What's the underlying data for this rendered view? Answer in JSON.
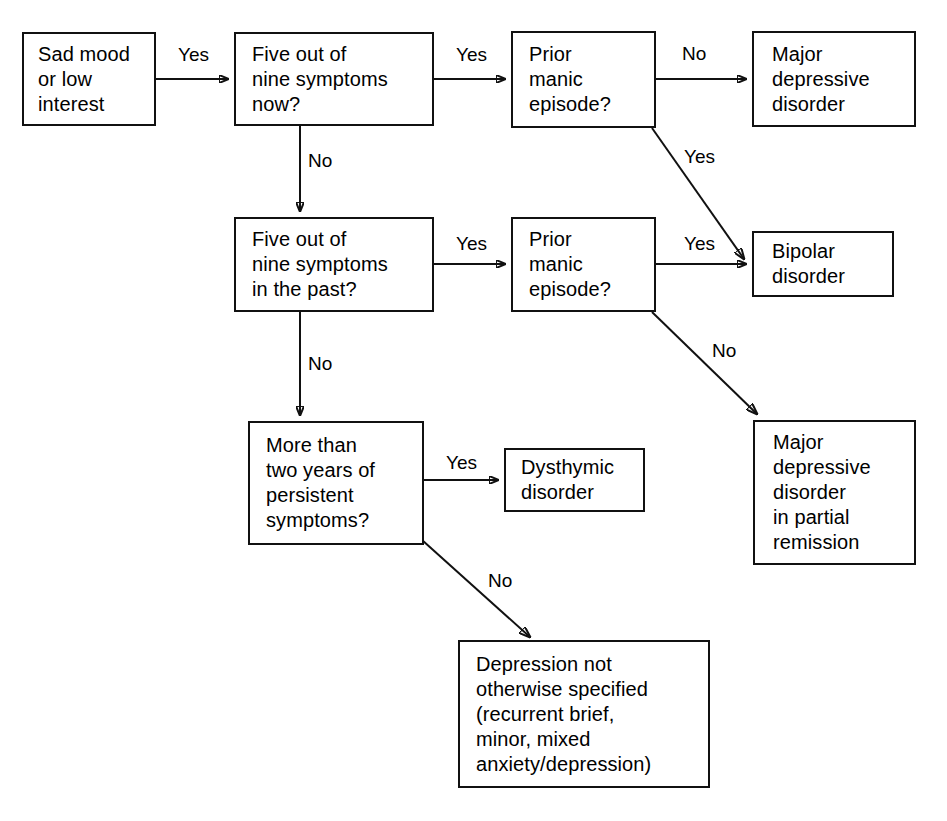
{
  "diagram": {
    "background_color": "#ffffff",
    "line_color": "#111111",
    "text_color": "#000000",
    "nodes": [
      {
        "id": "sad_mood",
        "text": "Sad mood\nor low\ninterest",
        "x": 22,
        "y": 32,
        "w": 134,
        "h": 94,
        "pad_left": 14,
        "indent": "none"
      },
      {
        "id": "five_now",
        "text": "Five out of\n  nine symptoms\n  now?",
        "x": 234,
        "y": 32,
        "w": 200,
        "h": 94,
        "pad_left": 16,
        "indent": "hanging"
      },
      {
        "id": "prior_manic_1",
        "text": "Prior\n  manic\n  episode?",
        "x": 511,
        "y": 31,
        "w": 145,
        "h": 97,
        "pad_left": 16,
        "indent": "hanging"
      },
      {
        "id": "major_depressive",
        "text": "Major\n  depressive\n  disorder",
        "x": 752,
        "y": 31,
        "w": 164,
        "h": 96,
        "pad_left": 18,
        "indent": "hanging"
      },
      {
        "id": "five_past",
        "text": "Five out of\n  nine symptoms\n  in the past?",
        "x": 234,
        "y": 217,
        "w": 200,
        "h": 95,
        "pad_left": 16,
        "indent": "hanging"
      },
      {
        "id": "prior_manic_2",
        "text": "Prior\n  manic\n  episode?",
        "x": 511,
        "y": 217,
        "w": 145,
        "h": 95,
        "pad_left": 16,
        "indent": "hanging"
      },
      {
        "id": "bipolar",
        "text": "Bipolar\n  disorder",
        "x": 752,
        "y": 231,
        "w": 142,
        "h": 66,
        "pad_left": 18,
        "indent": "hanging"
      },
      {
        "id": "two_years",
        "text": "More than\n  two years of\n  persistent\n  symptoms?",
        "x": 248,
        "y": 421,
        "w": 176,
        "h": 124,
        "pad_left": 16,
        "indent": "hanging"
      },
      {
        "id": "dysthymic",
        "text": "Dysthymic\n  disorder",
        "x": 504,
        "y": 448,
        "w": 141,
        "h": 64,
        "pad_left": 15,
        "indent": "hanging"
      },
      {
        "id": "partial_remission",
        "text": "Major\n  depressive\n  disorder\n  in partial\n  remission",
        "x": 753,
        "y": 420,
        "w": 163,
        "h": 145,
        "pad_left": 18,
        "indent": "hanging"
      },
      {
        "id": "depression_nos",
        "text": "Depression not\n  otherwise specified\n  (recurrent brief,\n  minor, mixed\n  anxiety/depression)",
        "x": 458,
        "y": 640,
        "w": 252,
        "h": 148,
        "pad_left": 16,
        "indent": "hanging"
      }
    ],
    "edge_labels": [
      {
        "id": "lbl_yes_1",
        "text": "Yes",
        "x": 178,
        "y": 44
      },
      {
        "id": "lbl_yes_2",
        "text": "Yes",
        "x": 456,
        "y": 44
      },
      {
        "id": "lbl_no_1",
        "text": "No",
        "x": 682,
        "y": 43
      },
      {
        "id": "lbl_no_2",
        "text": "No",
        "x": 308,
        "y": 150
      },
      {
        "id": "lbl_yes_3",
        "text": "Yes",
        "x": 684,
        "y": 146
      },
      {
        "id": "lbl_yes_4",
        "text": "Yes",
        "x": 456,
        "y": 233
      },
      {
        "id": "lbl_yes_5",
        "text": "Yes",
        "x": 684,
        "y": 233
      },
      {
        "id": "lbl_no_3",
        "text": "No",
        "x": 308,
        "y": 353
      },
      {
        "id": "lbl_no_4",
        "text": "No",
        "x": 712,
        "y": 340
      },
      {
        "id": "lbl_yes_6",
        "text": "Yes",
        "x": 446,
        "y": 452
      },
      {
        "id": "lbl_no_5",
        "text": "No",
        "x": 488,
        "y": 570
      }
    ],
    "edges": [
      {
        "id": "e-sadmood-to-fivenow",
        "type": "straight",
        "from": "sad_mood",
        "to": "five_now",
        "answer": "Yes",
        "d": "M 156 79 L 228 79"
      },
      {
        "id": "e-fivenow-to-priormanic1",
        "type": "straight",
        "from": "five_now",
        "to": "prior_manic_1",
        "answer": "Yes",
        "d": "M 434 79 L 505 79"
      },
      {
        "id": "e-priormanic1-to-majordep",
        "type": "straight",
        "from": "prior_manic_1",
        "to": "major_depressive",
        "answer": "No",
        "d": "M 656 79 L 746 79"
      },
      {
        "id": "e-fivenow-to-fivepast",
        "type": "straight",
        "from": "five_now",
        "to": "five_past",
        "answer": "No",
        "d": "M 300 126 L 300 211"
      },
      {
        "id": "e-priormanic1-to-bipolar",
        "type": "diagonal",
        "from": "prior_manic_1",
        "to": "bipolar",
        "answer": "Yes",
        "d": "M 652 128 L 744 259"
      },
      {
        "id": "e-fivepast-to-priormanic2",
        "type": "straight",
        "from": "five_past",
        "to": "prior_manic_2",
        "answer": "Yes",
        "d": "M 434 264 L 505 264"
      },
      {
        "id": "e-priormanic2-to-bipolar",
        "type": "straight",
        "from": "prior_manic_2",
        "to": "bipolar",
        "answer": "Yes",
        "d": "M 656 264 L 746 264"
      },
      {
        "id": "e-fivepast-to-twoyears",
        "type": "straight",
        "from": "five_past",
        "to": "two_years",
        "answer": "No",
        "d": "M 300 312 L 300 415"
      },
      {
        "id": "e-priormanic2-to-partial",
        "type": "diagonal",
        "from": "prior_manic_2",
        "to": "partial_remission",
        "answer": "No",
        "d": "M 652 312 L 757 414"
      },
      {
        "id": "e-twoyears-to-dysthymic",
        "type": "straight",
        "from": "two_years",
        "to": "dysthymic",
        "answer": "Yes",
        "d": "M 424 480 L 498 480"
      },
      {
        "id": "e-twoyears-to-nos",
        "type": "diagonal",
        "from": "two_years",
        "to": "depression_nos",
        "answer": "No",
        "d": "M 422 540 L 530 637"
      }
    ]
  }
}
